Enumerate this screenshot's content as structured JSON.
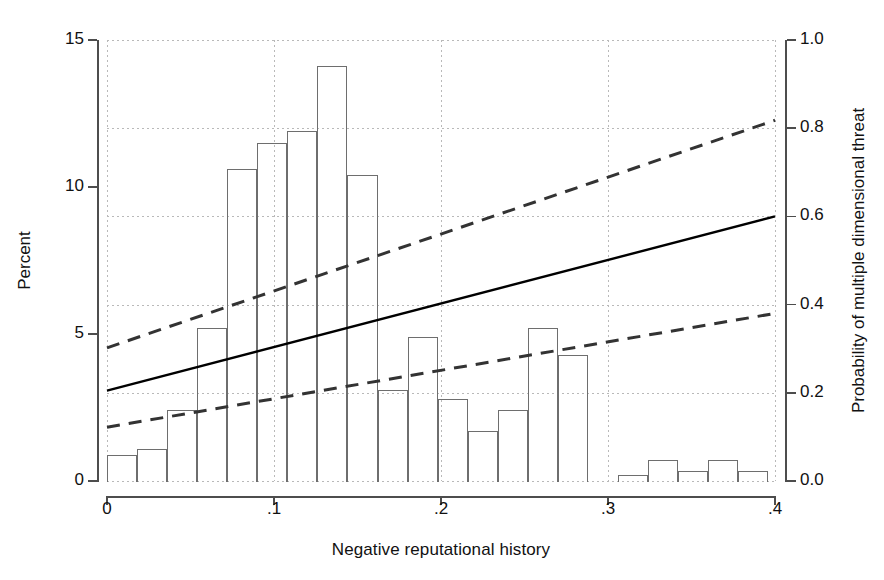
{
  "chart_data": {
    "type": "bar",
    "title": "",
    "subtitle": "",
    "xlabel": "Negative reputational history",
    "ylabel": "Percent",
    "ylabel_right": "Probability of multiple dimensional threat",
    "xlim": [
      0,
      0.4
    ],
    "ylim": [
      0,
      15
    ],
    "ylim_right": [
      0.0,
      1.0
    ],
    "xticks": [
      0,
      0.1,
      0.2,
      0.3,
      0.4
    ],
    "xticklabels": [
      "0",
      ".1",
      ".2",
      ".3",
      ".4"
    ],
    "yticks": [
      0,
      5,
      10,
      15
    ],
    "yticklabels": [
      "0",
      "5",
      "10",
      "15"
    ],
    "yticks_right": [
      0.0,
      0.2,
      0.4,
      0.6,
      0.8,
      1.0
    ],
    "yticklabels_right": [
      "0.0",
      "0.2",
      "0.4",
      "0.6",
      "0.8",
      "1.0"
    ],
    "grid": true,
    "grid_style": "dotted",
    "legend": "none",
    "bin_width": 0.018,
    "bar_style": "outline-only",
    "categories": [
      0.009,
      0.027,
      0.045,
      0.063,
      0.081,
      0.099,
      0.117,
      0.135,
      0.153,
      0.171,
      0.189,
      0.207,
      0.225,
      0.243,
      0.261,
      0.279,
      0.315,
      0.333,
      0.351,
      0.369,
      0.387
    ],
    "values": [
      0.9,
      1.1,
      2.4,
      5.2,
      10.6,
      11.5,
      11.9,
      14.1,
      10.4,
      3.1,
      4.9,
      2.8,
      1.7,
      2.4,
      5.2,
      4.3,
      0.2,
      0.7,
      0.35,
      0.7,
      0.35
    ],
    "bars": [
      {
        "x0": 0.0,
        "x1": 0.018,
        "value": 0.9
      },
      {
        "x0": 0.018,
        "x1": 0.036,
        "value": 1.1
      },
      {
        "x0": 0.036,
        "x1": 0.054,
        "value": 2.4
      },
      {
        "x0": 0.054,
        "x1": 0.072,
        "value": 5.2
      },
      {
        "x0": 0.072,
        "x1": 0.09,
        "value": 10.6
      },
      {
        "x0": 0.09,
        "x1": 0.108,
        "value": 11.5
      },
      {
        "x0": 0.108,
        "x1": 0.126,
        "value": 11.9
      },
      {
        "x0": 0.126,
        "x1": 0.144,
        "value": 14.1
      },
      {
        "x0": 0.144,
        "x1": 0.162,
        "value": 10.4
      },
      {
        "x0": 0.162,
        "x1": 0.18,
        "value": 3.1
      },
      {
        "x0": 0.18,
        "x1": 0.198,
        "value": 4.9
      },
      {
        "x0": 0.198,
        "x1": 0.216,
        "value": 2.8
      },
      {
        "x0": 0.216,
        "x1": 0.234,
        "value": 1.7
      },
      {
        "x0": 0.234,
        "x1": 0.252,
        "value": 2.4
      },
      {
        "x0": 0.252,
        "x1": 0.27,
        "value": 5.2
      },
      {
        "x0": 0.27,
        "x1": 0.288,
        "value": 4.3
      },
      {
        "x0": 0.306,
        "x1": 0.324,
        "value": 0.2
      },
      {
        "x0": 0.324,
        "x1": 0.342,
        "value": 0.7
      },
      {
        "x0": 0.342,
        "x1": 0.36,
        "value": 0.35
      },
      {
        "x0": 0.36,
        "x1": 0.378,
        "value": 0.7
      },
      {
        "x0": 0.378,
        "x1": 0.396,
        "value": 0.35
      }
    ],
    "series": [
      {
        "name": "Predicted probability",
        "axis": "right",
        "style": "solid",
        "color": "#000000",
        "points": [
          [
            0.0,
            0.205
          ],
          [
            0.4,
            0.6
          ]
        ]
      },
      {
        "name": "Upper confidence bound",
        "axis": "right",
        "style": "dashed",
        "color": "#333333",
        "points": [
          [
            0.0,
            0.302
          ],
          [
            0.4,
            0.818
          ]
        ]
      },
      {
        "name": "Lower confidence bound",
        "axis": "right",
        "style": "dashed",
        "color": "#333333",
        "points": [
          [
            0.0,
            0.122
          ],
          [
            0.4,
            0.38
          ]
        ]
      }
    ]
  },
  "colors": {
    "axis": "#4d4d4d",
    "bar_outline": "#6e6e6e",
    "grid": "#b9b9b9",
    "line_solid": "#000000",
    "line_dashed": "#333333",
    "text": "#111111",
    "background": "#ffffff"
  }
}
